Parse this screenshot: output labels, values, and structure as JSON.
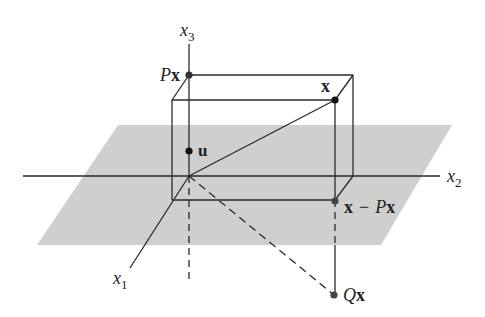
{
  "figure": {
    "colors": {
      "plane": "#cfcfcf",
      "line": "#2a2a2a",
      "point": "#222222",
      "background": "#ffffff"
    },
    "axes": {
      "x1": {
        "var": "x",
        "sub": "1"
      },
      "x2": {
        "var": "x",
        "sub": "2"
      },
      "x3": {
        "var": "x",
        "sub": "3"
      }
    },
    "points": {
      "Px": {
        "op": "P",
        "vec": "x"
      },
      "x": {
        "vec": "x"
      },
      "u": {
        "vec": "u"
      },
      "x_minus_Px": {
        "vec": "x",
        "minus": "−",
        "op": "P",
        "vec2": "x"
      },
      "Qx": {
        "op": "Q",
        "vec": "x"
      }
    }
  }
}
